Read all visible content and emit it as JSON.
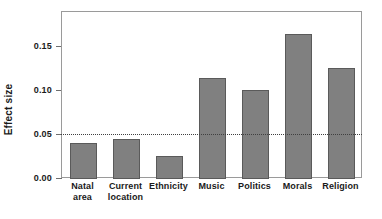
{
  "chart_data": {
    "type": "bar",
    "title": "",
    "xlabel": "",
    "ylabel": "Effect size",
    "categories": [
      "Natal\narea",
      "Current\nlocation",
      "Ethnicity",
      "Music",
      "Politics",
      "Morals",
      "Religion"
    ],
    "values": [
      0.041,
      0.046,
      0.026,
      0.115,
      0.101,
      0.165,
      0.126
    ],
    "ylim": [
      0.0,
      0.19
    ],
    "yticks": [
      0.0,
      0.05,
      0.1,
      0.15
    ],
    "ytick_labels": [
      "0.00",
      "0.05",
      "0.10",
      "0.15"
    ],
    "grid": false,
    "legend": "none",
    "reference_line": {
      "value": 0.05,
      "style": "dotted",
      "color": "#404040"
    },
    "bar_color": "#808080",
    "bar_edge_color": "#5a5a5a"
  },
  "axis": {
    "y_title": "Effect size"
  }
}
